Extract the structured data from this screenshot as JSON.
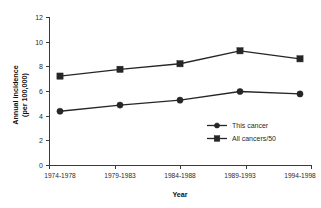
{
  "chart_data": {
    "type": "line",
    "title": "",
    "xlabel": "Year",
    "ylabel": "Annual incidence (per 100,000)",
    "ylabel_line1": "Annual incidence",
    "ylabel_line2": "(per 100,000)",
    "categories": [
      "1974-1978",
      "1979-1983",
      "1984-1988",
      "1989-1993",
      "1994-1998"
    ],
    "yticks": [
      "0",
      "2",
      "4",
      "6",
      "8",
      "10",
      "12"
    ],
    "ytick_values": [
      0,
      2,
      4,
      6,
      8,
      10,
      12
    ],
    "ylim": [
      0,
      12
    ],
    "grid": false,
    "legend_position": "inside-lower-right",
    "series": [
      {
        "name": "This cancer",
        "marker": "circle",
        "color": "#262626",
        "values": [
          4.4,
          4.9,
          5.3,
          6.0,
          5.8
        ]
      },
      {
        "name": "All cancers/50",
        "marker": "square",
        "color": "#262626",
        "values": [
          7.25,
          7.8,
          8.25,
          9.3,
          8.65
        ]
      }
    ]
  },
  "legend": {
    "items": [
      {
        "label": "This cancer",
        "marker": "circle"
      },
      {
        "label": "All cancers/50",
        "marker": "square"
      }
    ]
  }
}
